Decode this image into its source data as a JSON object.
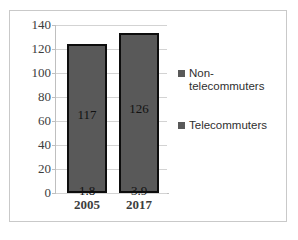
{
  "title_strip": "",
  "chart_data": {
    "type": "bar",
    "subtype": "stacked-column",
    "title": "",
    "xlabel": "",
    "ylabel": "",
    "categories": [
      "2005",
      "2017"
    ],
    "series": [
      {
        "name": "Telecommuters",
        "values": [
          1.8,
          3.9
        ],
        "labels": [
          "1.8",
          "3.9"
        ]
      },
      {
        "name": "Non-telecommuters",
        "values": [
          117,
          126
        ],
        "labels": [
          "117",
          "126"
        ]
      }
    ],
    "totals": [
      118.8,
      129.9
    ],
    "ylim": [
      0,
      140
    ],
    "ytick_step": 20,
    "yticks": [
      "140",
      "120",
      "100",
      "80",
      "60",
      "40",
      "20",
      "0"
    ],
    "grid": true,
    "legend_position": "right",
    "colors": {
      "bar_fill": "#595959",
      "bar_outline": "#0d0d0d",
      "gridline": "#d3d3d3",
      "axis": "#bfbfbf",
      "frame": "#c9c9c9",
      "text": "#3d3d3d"
    }
  },
  "legend": {
    "entries": [
      {
        "label": "Non-telecommuters"
      },
      {
        "label": "Telecommuters"
      }
    ]
  }
}
